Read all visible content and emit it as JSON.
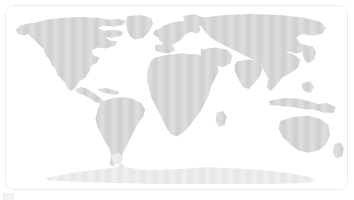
{
  "panel": {
    "title": "World Map",
    "border_color": "#ececec",
    "background_color": "#ffffff",
    "corner_radius_px": "9"
  },
  "map": {
    "name": "world-map",
    "projection": "robinson",
    "land_color": "#d2d2d2",
    "ocean_color": "#ffffff",
    "texture": "vertical-halftone-stripes",
    "regions": [
      {
        "id": "north-america",
        "label": "North America"
      },
      {
        "id": "greenland",
        "label": "Greenland"
      },
      {
        "id": "central-america",
        "label": "Central America"
      },
      {
        "id": "caribbean",
        "label": "Caribbean"
      },
      {
        "id": "south-america",
        "label": "South America"
      },
      {
        "id": "europe",
        "label": "Europe"
      },
      {
        "id": "africa",
        "label": "Africa"
      },
      {
        "id": "middle-east",
        "label": "Middle East"
      },
      {
        "id": "asia",
        "label": "Asia"
      },
      {
        "id": "india",
        "label": "India"
      },
      {
        "id": "southeast-asia",
        "label": "Southeast Asia"
      },
      {
        "id": "indonesia",
        "label": "Indonesia"
      },
      {
        "id": "japan",
        "label": "Japan"
      },
      {
        "id": "australia",
        "label": "Australia"
      },
      {
        "id": "new-zealand",
        "label": "New Zealand"
      },
      {
        "id": "antarctica",
        "label": "Antarctica"
      }
    ]
  },
  "handle": {
    "name": "resize-handle",
    "color": "#f4f4f4"
  }
}
